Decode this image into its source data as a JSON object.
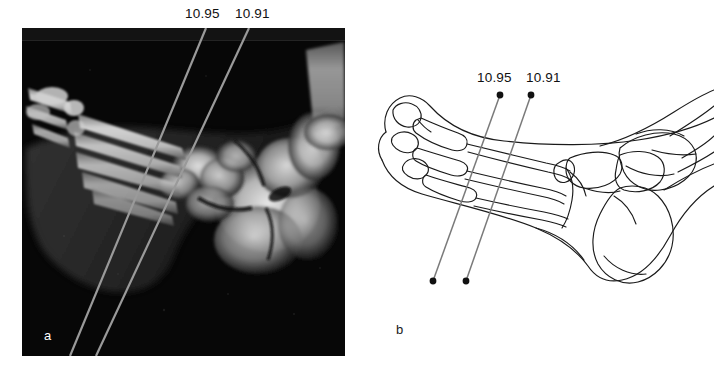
{
  "figure": {
    "panels": [
      {
        "id": "a",
        "letter": "a",
        "kind": "radiograph",
        "description": "Lateral radiograph of the foot with two oblique measurement lines",
        "labels": [
          {
            "name": "line-1",
            "value": "10.95"
          },
          {
            "name": "line-2",
            "value": "10.91"
          }
        ]
      },
      {
        "id": "b",
        "letter": "b",
        "kind": "line-drawing",
        "description": "Line drawing tracing of the same lateral foot with the two measurement lines marked by endpoint dots",
        "labels": [
          {
            "name": "line-1",
            "value": "10.95"
          },
          {
            "name": "line-2",
            "value": "10.91"
          }
        ]
      }
    ],
    "measurement_lines": [
      {
        "id": "line-1095",
        "label": "10.95",
        "color": "#9a9a9a",
        "panel_a": {
          "x1": 206,
          "y1": 28,
          "x2": 70,
          "y2": 356
        },
        "panel_b": {
          "x1": 500,
          "y1": 95,
          "x2": 433,
          "y2": 281
        }
      },
      {
        "id": "line-1091",
        "label": "10.91",
        "color": "#9a9a9a",
        "panel_a": {
          "x1": 249,
          "y1": 28,
          "x2": 96,
          "y2": 356
        },
        "panel_b": {
          "x1": 531,
          "y1": 95,
          "x2": 466,
          "y2": 281
        }
      }
    ],
    "colors": {
      "background": "#ffffff",
      "xray_background": "#050505",
      "line_overlay": "#9a9a9a",
      "drawing_stroke": "#1a1a1a",
      "text": "#111111",
      "panel_a_letter": "#ffffff"
    }
  }
}
